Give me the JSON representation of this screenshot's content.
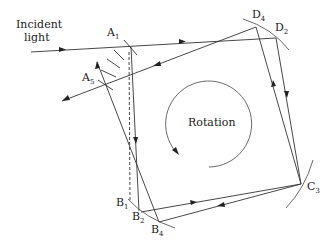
{
  "labels": {
    "incident_line1": "Incident",
    "incident_line2": "light",
    "rotation": "Rotation",
    "A1": {
      "base": "A",
      "sub": "1"
    },
    "A5": {
      "base": "A",
      "sub": "5"
    },
    "D4": {
      "base": "D",
      "sub": "4"
    },
    "D2": {
      "base": "D",
      "sub": "2"
    },
    "C3": {
      "base": "C",
      "sub": "3"
    },
    "B1": {
      "base": "B",
      "sub": "1"
    },
    "B2": {
      "base": "B",
      "sub": "2"
    },
    "B4": {
      "base": "B",
      "sub": "4"
    }
  },
  "colors": {
    "line": "#333333",
    "background": "#ffffff"
  }
}
